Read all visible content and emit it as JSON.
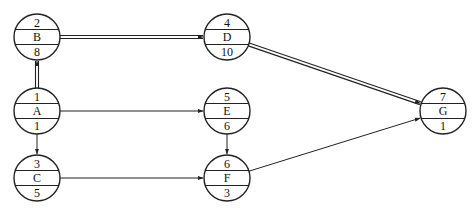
{
  "diagram": {
    "type": "network-diagram",
    "nodes": [
      {
        "key": "B",
        "id": "2",
        "name": "B",
        "duration": "8"
      },
      {
        "key": "D",
        "id": "4",
        "name": "D",
        "duration": "10"
      },
      {
        "key": "A",
        "id": "1",
        "name": "A",
        "duration": "1"
      },
      {
        "key": "E",
        "id": "5",
        "name": "E",
        "duration": "6"
      },
      {
        "key": "C",
        "id": "3",
        "name": "C",
        "duration": "5"
      },
      {
        "key": "F",
        "id": "6",
        "name": "F",
        "duration": "3"
      },
      {
        "key": "G",
        "id": "7",
        "name": "G",
        "duration": "1"
      }
    ],
    "edges": [
      {
        "from": "A",
        "to": "B",
        "critical": true
      },
      {
        "from": "B",
        "to": "D",
        "critical": true
      },
      {
        "from": "D",
        "to": "G",
        "critical": true
      },
      {
        "from": "A",
        "to": "E",
        "critical": false
      },
      {
        "from": "A",
        "to": "C",
        "critical": false
      },
      {
        "from": "E",
        "to": "F",
        "critical": false
      },
      {
        "from": "C",
        "to": "F",
        "critical": false
      },
      {
        "from": "F",
        "to": "G",
        "critical": false
      }
    ],
    "colors": {
      "stroke": "#222222",
      "text": "#111111",
      "background": "#ffffff"
    }
  }
}
